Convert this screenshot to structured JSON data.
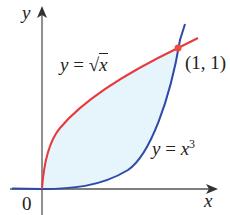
{
  "figure": {
    "axis_x_label": "x",
    "axis_y_label": "y",
    "origin_label": "0",
    "curve_sqrt_label_lhs": "y",
    "curve_sqrt_label_eq": " = ",
    "curve_sqrt_label_radicand": "x",
    "curve_cube_label_lhs": "y",
    "curve_cube_label_eq": " = ",
    "curve_cube_label_base": "x",
    "curve_cube_label_exp": "3",
    "intersection_label": "(1, 1)",
    "colors": {
      "sqrt_curve": "#e8393c",
      "cube_curve": "#2e4aa8",
      "region_fill": "#e6f4fb",
      "intersection_point": "#f04a3a",
      "axes": "#555555"
    }
  }
}
